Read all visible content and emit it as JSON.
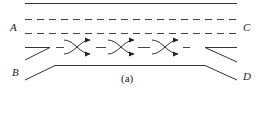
{
  "diagram": {
    "caption": "(a)",
    "labels": {
      "A": "A",
      "B": "B",
      "C": "C",
      "D": "D"
    },
    "elements": {
      "top_edge": "solid roadway edge",
      "lane_lines": [
        "dashed lane line",
        "dashed lane line"
      ],
      "weave_markers": 3,
      "entry_ramp": "B",
      "exit_ramp": "D",
      "approach": "A",
      "departure": "C"
    },
    "colors": {
      "line": "#333333",
      "background": "#ffffff"
    }
  }
}
